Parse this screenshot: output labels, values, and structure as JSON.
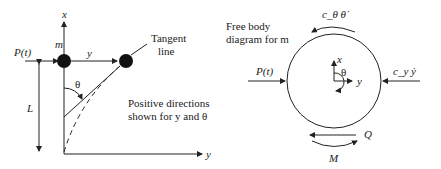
{
  "left_diagram": {
    "axis_x_label": "x",
    "axis_y_label": "y",
    "mass_label": "m",
    "force_label": "P(t)",
    "displacement_label": "y",
    "length_label": "L",
    "angle_label": "θ",
    "tangent_label_line1": "Tangent",
    "tangent_label_line2": "line",
    "note_line1": "Positive directions",
    "note_line2": "shown for y and θ"
  },
  "right_diagram": {
    "title_line1": "Free body",
    "title_line2": "diagram for m",
    "force_left": "P(t)",
    "damping_right": "c_y ẏ",
    "damping_rot": "c_θ θ̇",
    "shear_label": "Q",
    "moment_label": "M",
    "axis_x_label": "x",
    "axis_y_label": "y",
    "angle_label": "θ"
  }
}
